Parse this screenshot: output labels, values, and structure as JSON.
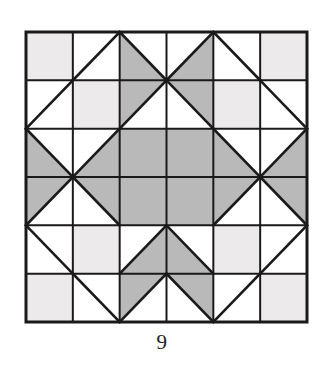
{
  "figure": {
    "caption": "9",
    "kind": "quilt-block-diagram"
  },
  "colors": {
    "background": "#ffffff",
    "stroke": "#1a1a1a",
    "white_patch": "#ffffff",
    "light_patch": "#eceaea",
    "medium_patch": "#b9b9b9",
    "caption_text": "#1d1d1d"
  },
  "grid": {
    "rows": 6,
    "cols": 6,
    "x": 26,
    "y": 32,
    "width": 281,
    "height": 290,
    "outer_stroke_width": 3,
    "inner_stroke_width": 2,
    "diagonal_stroke_width": 2.6
  },
  "legend": {
    "white_label": "white patch",
    "light_label": "light patch",
    "medium_label": "medium gray patch"
  },
  "cells": [
    [
      {
        "type": "solid",
        "fill": "light"
      },
      {
        "type": "diag",
        "dir": "/",
        "upper": "white",
        "lower": "white"
      },
      {
        "type": "diag",
        "dir": "\\",
        "upper": "white",
        "lower": "medium"
      },
      {
        "type": "diag",
        "dir": "/",
        "upper": "white",
        "lower": "medium"
      },
      {
        "type": "diag",
        "dir": "\\",
        "upper": "white",
        "lower": "white"
      },
      {
        "type": "solid",
        "fill": "light"
      }
    ],
    [
      {
        "type": "diag",
        "dir": "/",
        "upper": "white",
        "lower": "white"
      },
      {
        "type": "solid",
        "fill": "light"
      },
      {
        "type": "diag",
        "dir": "/",
        "upper": "medium",
        "lower": "white"
      },
      {
        "type": "diag",
        "dir": "\\",
        "upper": "medium",
        "lower": "white"
      },
      {
        "type": "solid",
        "fill": "light"
      },
      {
        "type": "diag",
        "dir": "\\",
        "upper": "white",
        "lower": "white"
      }
    ],
    [
      {
        "type": "diag",
        "dir": "\\",
        "upper": "white",
        "lower": "medium"
      },
      {
        "type": "diag",
        "dir": "/",
        "upper": "white",
        "lower": "medium"
      },
      {
        "type": "solid",
        "fill": "medium"
      },
      {
        "type": "solid",
        "fill": "medium"
      },
      {
        "type": "diag",
        "dir": "\\",
        "upper": "white",
        "lower": "medium"
      },
      {
        "type": "diag",
        "dir": "/",
        "upper": "white",
        "lower": "medium"
      }
    ],
    [
      {
        "type": "diag",
        "dir": "/",
        "upper": "medium",
        "lower": "white"
      },
      {
        "type": "diag",
        "dir": "\\",
        "upper": "medium",
        "lower": "white"
      },
      {
        "type": "solid",
        "fill": "medium"
      },
      {
        "type": "solid",
        "fill": "medium"
      },
      {
        "type": "diag",
        "dir": "/",
        "upper": "medium",
        "lower": "white"
      },
      {
        "type": "diag",
        "dir": "\\",
        "upper": "medium",
        "lower": "white"
      }
    ],
    [
      {
        "type": "diag",
        "dir": "\\",
        "upper": "white",
        "lower": "white"
      },
      {
        "type": "solid",
        "fill": "light"
      },
      {
        "type": "diag",
        "dir": "/",
        "upper": "white",
        "lower": "medium"
      },
      {
        "type": "diag",
        "dir": "\\",
        "upper": "white",
        "lower": "medium"
      },
      {
        "type": "solid",
        "fill": "light"
      },
      {
        "type": "diag",
        "dir": "/",
        "upper": "white",
        "lower": "white"
      }
    ],
    [
      {
        "type": "solid",
        "fill": "light"
      },
      {
        "type": "diag",
        "dir": "\\",
        "upper": "white",
        "lower": "white"
      },
      {
        "type": "diag",
        "dir": "/",
        "upper": "medium",
        "lower": "white"
      },
      {
        "type": "diag",
        "dir": "\\",
        "upper": "medium",
        "lower": "white"
      },
      {
        "type": "diag",
        "dir": "/",
        "upper": "white",
        "lower": "white"
      },
      {
        "type": "solid",
        "fill": "light"
      }
    ]
  ]
}
